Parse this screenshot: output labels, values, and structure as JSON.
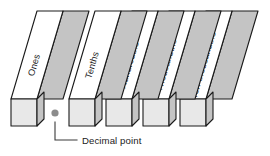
{
  "diagram": {
    "background_color": "#ffffff",
    "colors": {
      "front_face": "#e8e8e8",
      "top_face": "#ffffff",
      "side_face": "#c4c4c4",
      "outline": "#1a1a1a",
      "text": "#1a1a1a",
      "dot": "#8c8c8c",
      "leader": "#3a3a3a"
    },
    "bars": [
      {
        "label": "Ones",
        "front_x": 11,
        "front_y": 99
      },
      {
        "label": "Tenths",
        "front_x": 69,
        "front_y": 99
      },
      {
        "label": "Hundredths",
        "front_x": 106,
        "front_y": 99
      },
      {
        "label": "Thousandths",
        "front_x": 143,
        "front_y": 99
      },
      {
        "label": "Ten-thousandths",
        "front_x": 180,
        "front_y": 99
      }
    ],
    "decimal_point": {
      "marker_name": "decimal-point-dot",
      "caption": "Decimal point",
      "dot_x": 55,
      "dot_y": 113,
      "caption_x": 82,
      "caption_y": 144
    }
  }
}
